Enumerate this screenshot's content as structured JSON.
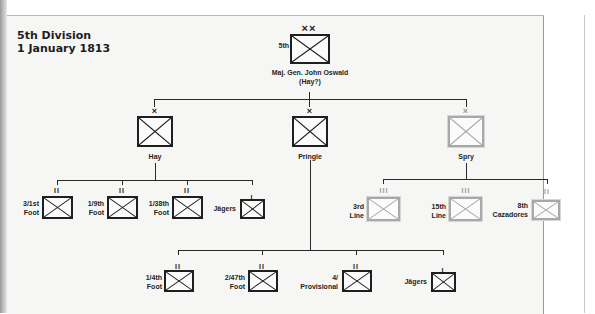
{
  "title": {
    "line1": "5th Division",
    "line2": "1 January 1813"
  },
  "colors": {
    "british_unit": "#1f1f1f",
    "portuguese_unit": "#a8a8a8",
    "background": "#f6f6f4"
  },
  "division": {
    "echelon": "××",
    "designation": "5th",
    "commander_line1": "Maj. Gen. John Oswald",
    "commander_line2": "(Hay?)",
    "symbol": "infantry-cross-box"
  },
  "brigades": [
    {
      "name": "Hay",
      "echelon": "×",
      "nationality": "british",
      "units": [
        {
          "label_line1": "3/1st",
          "label_line2": "Foot",
          "echelon": "II"
        },
        {
          "label_line1": "1/9th",
          "label_line2": "Foot",
          "echelon": "II"
        },
        {
          "label_line1": "1/38th",
          "label_line2": "Foot",
          "echelon": "II"
        },
        {
          "label_line1": "Jägers",
          "label_line2": "",
          "echelon": "I"
        }
      ]
    },
    {
      "name": "Pringle",
      "echelon": "×",
      "nationality": "british",
      "units": [
        {
          "label_line1": "1/4th",
          "label_line2": "Foot",
          "echelon": "II"
        },
        {
          "label_line1": "2/47th",
          "label_line2": "Foot",
          "echelon": "II"
        },
        {
          "label_line1": "4/",
          "label_line2": "Provisional",
          "echelon": "II"
        },
        {
          "label_line1": "Jägers",
          "label_line2": "",
          "echelon": "I"
        }
      ]
    },
    {
      "name": "Spry",
      "echelon": "×",
      "nationality": "portuguese",
      "units": [
        {
          "label_line1": "3rd",
          "label_line2": "Line",
          "echelon": "III"
        },
        {
          "label_line1": "15th",
          "label_line2": "Line",
          "echelon": "III"
        },
        {
          "label_line1": "8th",
          "label_line2": "Cazadores",
          "echelon": "II"
        }
      ]
    }
  ]
}
